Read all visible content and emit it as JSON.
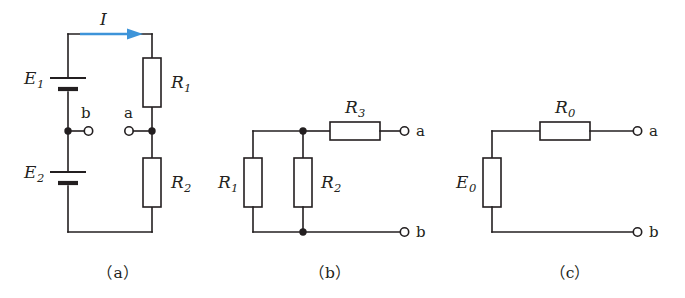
{
  "figure": {
    "background_color": "#ffffff",
    "wire_color": "#231f20",
    "current_arrow_color": "#3d94d9"
  },
  "circuit_a": {
    "caption": "（a）",
    "current_label": "I",
    "current_label_sub": "",
    "sources": [
      {
        "name": "E",
        "sub": "1",
        "type": "battery"
      },
      {
        "name": "E",
        "sub": "2",
        "type": "battery"
      }
    ],
    "resistors": [
      {
        "name": "R",
        "sub": "1",
        "type": "resistor"
      },
      {
        "name": "R",
        "sub": "2",
        "type": "resistor"
      }
    ],
    "terminals": [
      {
        "label": "b",
        "side": "left"
      },
      {
        "label": "a",
        "side": "right"
      }
    ]
  },
  "circuit_b": {
    "caption": "（b）",
    "resistors": [
      {
        "name": "R",
        "sub": "1",
        "orientation": "vertical"
      },
      {
        "name": "R",
        "sub": "2",
        "orientation": "vertical"
      },
      {
        "name": "R",
        "sub": "3",
        "orientation": "horizontal"
      }
    ],
    "terminals": [
      {
        "label": "a",
        "side": "top-right"
      },
      {
        "label": "b",
        "side": "bottom-right"
      }
    ]
  },
  "circuit_c": {
    "caption": "（c）",
    "sources": [
      {
        "name": "E",
        "sub": "0",
        "type": "box"
      }
    ],
    "resistors": [
      {
        "name": "R",
        "sub": "0",
        "orientation": "horizontal"
      }
    ],
    "terminals": [
      {
        "label": "a",
        "side": "top-right"
      },
      {
        "label": "b",
        "side": "bottom-right"
      }
    ]
  }
}
